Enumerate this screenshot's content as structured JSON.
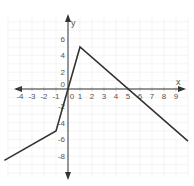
{
  "chart_data": {
    "type": "line",
    "title": "",
    "xlabel": "x",
    "ylabel": "y",
    "xlim": [
      -4.5,
      10.2
    ],
    "ylim": [
      -9.7,
      8.2
    ],
    "grid": true,
    "x_ticks": [
      -4,
      -3,
      -2,
      -1,
      0,
      1,
      2,
      3,
      4,
      5,
      6,
      7,
      8,
      9
    ],
    "x_tick_labels": [
      "-4",
      "-3",
      "-2",
      "-1",
      "0",
      "1",
      "2",
      "3",
      "4",
      "5",
      "6",
      "7",
      "8",
      "9"
    ],
    "y_ticks": [
      6,
      4,
      2,
      0,
      -2,
      -4,
      -6,
      -8
    ],
    "y_tick_labels": [
      "6",
      "4",
      "2",
      "0",
      "-2",
      "-4",
      "-6",
      "-8"
    ],
    "series": [
      {
        "name": "piecewise linear function",
        "points": [
          [
            -5.3,
            -8.5
          ],
          [
            -1,
            -5
          ],
          [
            1,
            5
          ],
          [
            10,
            -6.2
          ]
        ],
        "color": "#333333"
      }
    ],
    "annotations": []
  },
  "colors": {
    "axis": "#333333",
    "grid": "#ececec",
    "line": "#333333",
    "tick_text": "#555555"
  }
}
